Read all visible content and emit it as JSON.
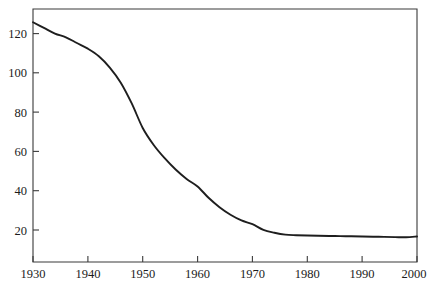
{
  "chart_data": {
    "type": "line",
    "title": "",
    "subtitle": "",
    "xlabel": "",
    "ylabel": "",
    "xlim": [
      1930,
      2000
    ],
    "ylim": [
      0,
      134
    ],
    "grid": false,
    "legend": null,
    "legend_position": "none",
    "line_color": "#1e1e1e",
    "axis_color": "#3a3a3a",
    "background_color": "#ffffff",
    "xticks": [
      1930,
      1940,
      1950,
      1960,
      1970,
      1980,
      1990,
      2000
    ],
    "xtick_labels": [
      "1930",
      "1940",
      "1950",
      "1960",
      "1970",
      "1980",
      "1990",
      "2000"
    ],
    "yticks": [
      20,
      40,
      60,
      80,
      100,
      120
    ],
    "ytick_labels": [
      "20",
      "40",
      "60",
      "80",
      "100",
      "120"
    ],
    "series": [
      {
        "name": "",
        "x": [
          1930,
          1932,
          1934,
          1936,
          1938,
          1940,
          1942,
          1944,
          1946,
          1948,
          1950,
          1952,
          1954,
          1956,
          1958,
          1960,
          1962,
          1964,
          1966,
          1968,
          1970,
          1972,
          1974,
          1976,
          1978,
          1980,
          1982,
          1984,
          1986,
          1988,
          1990,
          1992,
          1994,
          1996,
          1998,
          2000
        ],
        "values": [
          127,
          124,
          121,
          119,
          116,
          113,
          109,
          103,
          95,
          84,
          71,
          62,
          55,
          49,
          44,
          40,
          34,
          29,
          25,
          22,
          20,
          17,
          15.5,
          14.5,
          14.2,
          14,
          13.9,
          13.8,
          13.7,
          13.6,
          13.5,
          13.4,
          13.3,
          13.2,
          13.1,
          13.5
        ]
      }
    ]
  }
}
